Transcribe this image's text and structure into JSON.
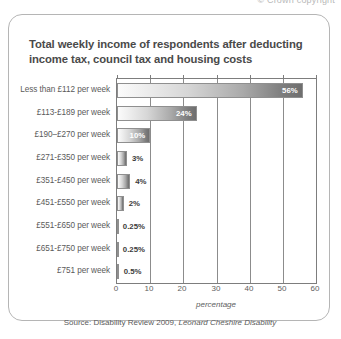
{
  "page": {
    "header_note": "© Crown copyright"
  },
  "card": {
    "title": "Total weekly income of respondents after deducting income tax, council tax and housing costs",
    "source_prefix": "Source: Disability Review 2009,",
    "source_publisher": "Leonard Cheshire Disability"
  },
  "chart_data": {
    "type": "bar",
    "orientation": "horizontal",
    "title": "Total weekly income of respondents after deducting income tax, council tax and housing costs",
    "xlabel": "percentage",
    "ylabel": "",
    "xlim": [
      0,
      60
    ],
    "xticks": [
      "0",
      "10",
      "20",
      "30",
      "40",
      "50",
      "60"
    ],
    "xtick_values": [
      0,
      10,
      20,
      30,
      40,
      50,
      60
    ],
    "grid": true,
    "legend": false,
    "categories": [
      "Less than £112 per week",
      "£113-£189 per week",
      "£190–£270 per week",
      "£271-£350 per week",
      "£351-£450 per week",
      "£451-£550 per week",
      "£551-£650 per week",
      "£651-£750 per week",
      "£751 per week"
    ],
    "values": [
      56,
      24,
      10,
      3,
      4,
      2,
      0.25,
      0.25,
      0.5
    ],
    "labels": [
      "56%",
      "24%",
      "10%",
      "3%",
      "4%",
      "2%",
      "0.25%",
      "0.25%",
      "0.5%"
    ],
    "label_placement": [
      "inside",
      "inside",
      "inside",
      "outside",
      "outside",
      "outside",
      "outside",
      "outside",
      "outside"
    ],
    "bar_gradient": [
      "#fbfbfb",
      "#6e6e6e"
    ],
    "bar_border_color": "#8f8f8f",
    "axis_color": "#7d7d7d",
    "source": "Source: Disability Review 2009, Leonard Cheshire Disability"
  }
}
